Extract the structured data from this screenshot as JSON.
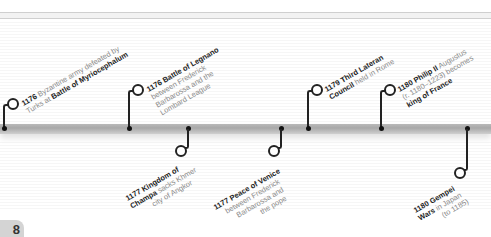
{
  "page": {
    "number_fragment": "8"
  },
  "timeline": {
    "above": [
      {
        "year": "1176",
        "lines": [
          [
            "",
            " Byzantine army defeated by"
          ],
          [
            "Turks at ",
            ""
          ]
        ],
        "bold_tail": "Battle of Myriocephalum",
        "l1_year": "1176",
        "l1_text": " Byzantine army defeated by",
        "l2_plain": "Turks at ",
        "l2_bold": "Battle of Myriocephalum"
      },
      {
        "l1_year": "1176",
        "l1_bold": " Battle of Legnano",
        "l2": "between Frederick",
        "l3": "Barbarossa and the",
        "l4": "Lombard League"
      },
      {
        "l1_year": "1179",
        "l1_bold": " Third Lateran",
        "l2_bold": "Council",
        "l2_plain": " held in Rome"
      },
      {
        "l1_year": "1180",
        "l1_bold": " Philip II",
        "l1_plain": " Augustus",
        "l2": "(r. 1180–1223) becomes",
        "l3_bold": "king of France"
      }
    ],
    "below": [
      {
        "l1_year": "1177",
        "l1_bold": " Kingdom of",
        "l2_bold": "Champa",
        "l2_plain": " sacks Khmer",
        "l3": "city of Angkor"
      },
      {
        "l1_year": "1177",
        "l1_bold": " Peace of Venice",
        "l2": "between Frederick",
        "l3": "Barbarossa and",
        "l4": "the pope"
      },
      {
        "l1_year": "1180",
        "l1_bold": " Gempei",
        "l2_bold": "Wars",
        "l2_plain": " in Japan",
        "l3": "(to 1185)"
      }
    ]
  },
  "colors": {
    "bar": "#a8a8a8",
    "ink": "#222222",
    "muted_text": "#8a8a8a",
    "badge": "#d4d4d4"
  }
}
